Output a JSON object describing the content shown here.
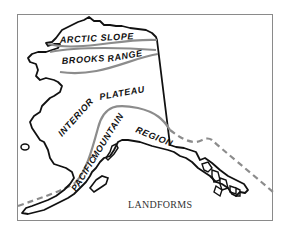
{
  "map": {
    "title": "LANDFORMS",
    "regions": [
      {
        "name": "ARCTIC SLOPE"
      },
      {
        "name": "BROOKS RANGE"
      },
      {
        "name": "INTERIOR PLATEAU"
      },
      {
        "name": "PACIFIC MOUNTAIN REGION"
      }
    ],
    "labels": {
      "arctic_slope": "ARCTIC SLOPE",
      "brooks": "BROOKS",
      "range": "RANGE",
      "interior": "INTERIOR",
      "plateau": "PLATEAU",
      "pacific": "PACIFIC",
      "mountain": "MOUNTAIN",
      "region": "REGION"
    },
    "colors": {
      "coastline": "#111111",
      "region_boundary": "#8c8c8c",
      "dashed_boundary": "#8c8c8c",
      "frame": "#8a8a8a"
    }
  }
}
